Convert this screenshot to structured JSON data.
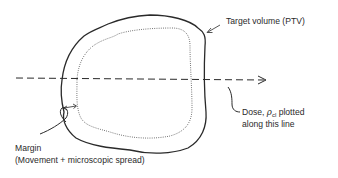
{
  "diagram": {
    "type": "target-volume-schematic",
    "colors": {
      "ink": "#2a2a2a",
      "background": "#ffffff"
    },
    "labels": {
      "target_volume": "Target volume (PTV)",
      "dose_line_1_prefix": "Dose, ",
      "dose_symbol": "ρ",
      "dose_subscript": "cl",
      "dose_line_1_suffix": " plotted",
      "dose_line_2": "along this line",
      "margin_title": "Margin",
      "margin_detail": "(Movement + microscopic spread)"
    },
    "elements": {
      "outer_contour": "solid outline — PTV",
      "inner_contour": "dotted outline — clinical target",
      "profile_line": "dashed horizontal arrow",
      "margin_indicator": "double-headed arrow between contours"
    }
  }
}
